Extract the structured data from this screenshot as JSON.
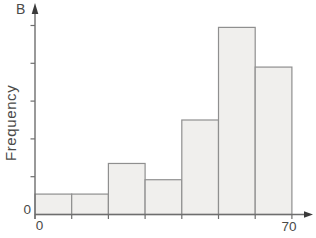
{
  "chart_data": {
    "type": "bar",
    "subtype": "histogram",
    "panel_label": "B",
    "ylabel": "Frequency",
    "x_min_label": "0",
    "y_origin_label": "0",
    "x_max_label": "70",
    "x_range": [
      0,
      70
    ],
    "bin_edges": [
      0,
      10,
      20,
      30,
      40,
      50,
      60,
      70
    ],
    "values": [
      0.54,
      0.54,
      1.35,
      0.92,
      2.5,
      4.95,
      3.9
    ],
    "y_axis": {
      "unlabeled_tick_count": 5,
      "ticks_labeled": false,
      "units_note": "tick units (y ticks unlabeled)",
      "arrow": true
    },
    "x_axis": {
      "tick_at_each_bin_edge": true,
      "arrow": true
    },
    "grid": false,
    "legend": "none",
    "colors": {
      "bar_fill": "#f0efed",
      "bar_stroke": "#8f8f8f",
      "axis": "#6e6e6e",
      "arrow": "#3a3a3a",
      "text": "#4a4a48",
      "background": "#ffffff"
    }
  }
}
